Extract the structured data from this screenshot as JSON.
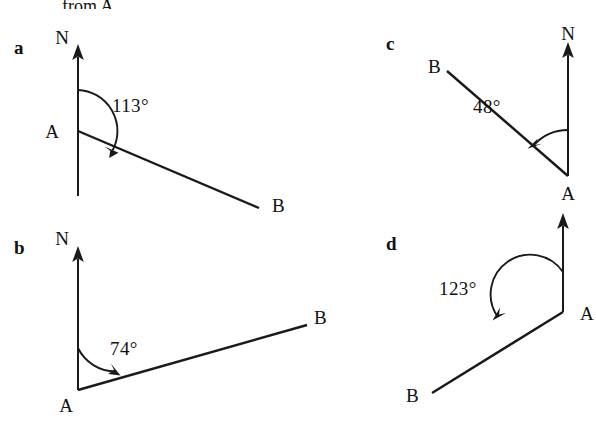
{
  "figure": {
    "caption_partial": "from A.",
    "background_color": "#ffffff",
    "ink_color": "#1a1a1a",
    "panels": [
      {
        "id": "a",
        "letter": "a",
        "north_label": "N",
        "vertex_label": "A",
        "endpoint_label": "B",
        "angle_text": "113°",
        "angle_value": 113,
        "bearing_direction": "clockwise from north",
        "description": "Bearing of B from A measured clockwise from north line at A; B lies below and to the right of A."
      },
      {
        "id": "b",
        "letter": "b",
        "north_label": "N",
        "vertex_label": "A",
        "endpoint_label": "B",
        "angle_text": "74°",
        "angle_value": 74,
        "bearing_direction": "clockwise from north",
        "description": "Bearing of B from A measured clockwise from north line at A; B lies above and to the right of A."
      },
      {
        "id": "c",
        "letter": "c",
        "north_label": "N",
        "vertex_label": "A",
        "endpoint_label": "B",
        "angle_text": "48°",
        "angle_value": 48,
        "bearing_direction": "anticlockwise from north",
        "description": "Angle at A between the north line and AB measured anticlockwise; B lies above and to the left of A."
      },
      {
        "id": "d",
        "letter": "d",
        "north_label": "",
        "vertex_label": "A",
        "endpoint_label": "B",
        "angle_text": "123°",
        "angle_value": 123,
        "bearing_direction": "anticlockwise from north",
        "description": "Angle at A between the north line and AB measured anticlockwise; B lies below and to the left of A."
      }
    ]
  }
}
